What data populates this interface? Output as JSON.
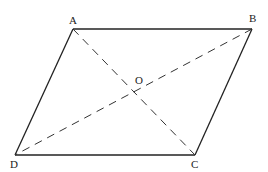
{
  "diagram": {
    "stroke_color": "#222222",
    "diagonal_color": "#333333",
    "points": {
      "A": {
        "label": "A",
        "x": 73,
        "y": 29,
        "lx": 72,
        "ly": 24
      },
      "B": {
        "label": "B",
        "x": 252,
        "y": 29,
        "lx": 253,
        "ly": 22
      },
      "C": {
        "label": "C",
        "x": 195,
        "y": 155,
        "lx": 195,
        "ly": 168
      },
      "D": {
        "label": "D",
        "x": 15,
        "y": 155,
        "lx": 14,
        "ly": 168
      },
      "O": {
        "label": "O",
        "x": 134,
        "y": 92,
        "lx": 138,
        "ly": 83
      }
    },
    "sides": [
      "AB",
      "BC",
      "CD",
      "DA"
    ],
    "diagonals": [
      "AC",
      "BD"
    ]
  }
}
